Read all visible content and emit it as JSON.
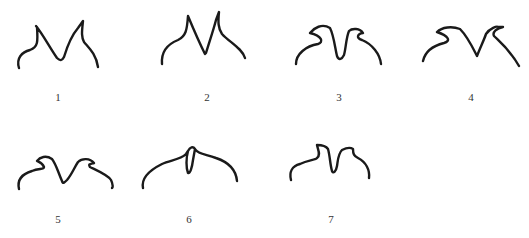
{
  "figure": {
    "panels": [
      {
        "label": "1",
        "x": 58,
        "y": 91
      },
      {
        "label": "2",
        "x": 207,
        "y": 91
      },
      {
        "label": "3",
        "x": 339,
        "y": 91
      },
      {
        "label": "4",
        "x": 471,
        "y": 91
      },
      {
        "label": "5",
        "x": 58,
        "y": 213
      },
      {
        "label": "6",
        "x": 189,
        "y": 213
      },
      {
        "label": "7",
        "x": 331,
        "y": 213
      }
    ],
    "stroke_color": "#1a1a1a",
    "background_color": "#ffffff"
  }
}
